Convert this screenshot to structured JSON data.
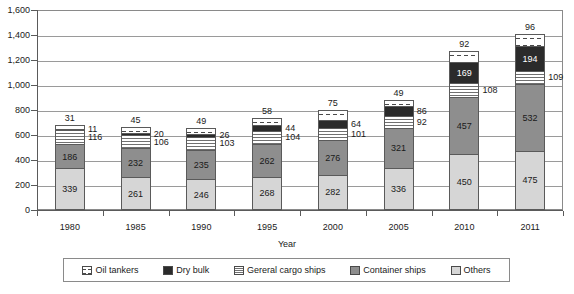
{
  "chart_data": {
    "type": "bar",
    "stacked": true,
    "title": "",
    "xlabel": "Year",
    "ylabel": "",
    "ylim": [
      0,
      1600
    ],
    "ytick_step": 200,
    "yticks": [
      "0",
      "200",
      "400",
      "600",
      "800",
      "1,000",
      "1,200",
      "1,400",
      "1,600"
    ],
    "grid": true,
    "legend_position": "bottom",
    "categories": [
      "1980",
      "1985",
      "1990",
      "1995",
      "2000",
      "2005",
      "2010",
      "2011"
    ],
    "stack_order_bottom_to_top": [
      "Others",
      "Container ships",
      "Gereral cargo ships",
      "Dry bulk",
      "Oil tankers"
    ],
    "series": [
      {
        "name": "Others",
        "pattern": "light-gray-fill",
        "values": [
          339,
          261,
          246,
          268,
          282,
          336,
          450,
          475
        ]
      },
      {
        "name": "Container ships",
        "pattern": "medium-gray-fill",
        "values": [
          186,
          232,
          235,
          262,
          276,
          321,
          457,
          532
        ]
      },
      {
        "name": "Gereral cargo ships",
        "pattern": "horizontal-lines",
        "values": [
          116,
          106,
          103,
          104,
          101,
          92,
          108,
          109
        ]
      },
      {
        "name": "Dry bulk",
        "pattern": "black-fill",
        "values": [
          11,
          20,
          26,
          44,
          64,
          86,
          169,
          194
        ]
      },
      {
        "name": "Oil tankers",
        "pattern": "dashed-white",
        "values": [
          31,
          45,
          49,
          58,
          75,
          49,
          92,
          96
        ]
      }
    ],
    "totals": [
      683,
      664,
      659,
      736,
      798,
      884,
      1276,
      1406
    ]
  },
  "axes": {
    "x_title": "Year"
  },
  "legend": {
    "items": [
      {
        "label": "Oil tankers",
        "swatch": "oil-tankers-swatch-icon"
      },
      {
        "label": "Dry bulk",
        "swatch": "dry-bulk-swatch-icon"
      },
      {
        "label": "Gereral cargo ships",
        "swatch": "general-cargo-swatch-icon"
      },
      {
        "label": "Container ships",
        "swatch": "container-ships-swatch-icon"
      },
      {
        "label": "Others",
        "swatch": "others-swatch-icon"
      }
    ]
  }
}
